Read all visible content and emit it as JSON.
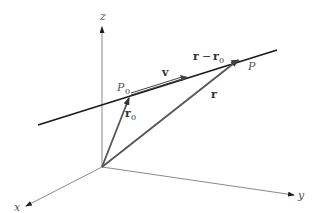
{
  "diagram": {
    "axes": {
      "x_label": "x",
      "y_label": "y",
      "z_label": "z"
    },
    "points": {
      "p0_label": "P",
      "p0_sub": "0",
      "p_label": "P"
    },
    "vectors": {
      "v_label": "v",
      "r0_label": "r",
      "r0_sub": "0",
      "r_label": "r",
      "diff_r": "r",
      "diff_op": "−",
      "diff_r0": "r",
      "diff_r0_sub": "0"
    },
    "colors": {
      "axis": "#777777",
      "line": "#1a1a1a",
      "vector": "#555555"
    }
  }
}
